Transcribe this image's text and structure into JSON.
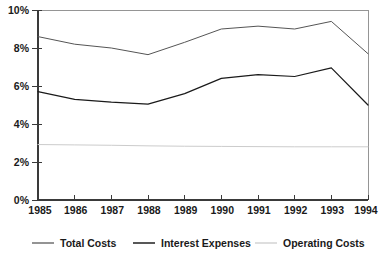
{
  "chart_data": {
    "type": "line",
    "title": "",
    "subtitle": "",
    "xlabel": "",
    "ylabel": "",
    "x": [
      1985,
      1986,
      1987,
      1988,
      1989,
      1990,
      1991,
      1992,
      1993,
      1994
    ],
    "categories": [
      "1985",
      "1986",
      "1987",
      "1988",
      "1989",
      "1990",
      "1991",
      "1992",
      "1993",
      "1994"
    ],
    "xlim": [
      1985,
      1994
    ],
    "ylim": [
      0,
      10
    ],
    "y_ticks": [
      0,
      2,
      4,
      6,
      8,
      10
    ],
    "y_tick_labels": [
      "0%",
      "2%",
      "4%",
      "6%",
      "8%",
      "10%"
    ],
    "x_tick_labels": [
      "1985",
      "1986",
      "1987",
      "1988",
      "1989",
      "1990",
      "1991",
      "1992",
      "1993",
      "1994"
    ],
    "grid": false,
    "legend_position": "bottom",
    "units": "percent",
    "series": [
      {
        "name": "Total Costs",
        "color": "#555555",
        "values": [
          8.6,
          8.2,
          8.0,
          7.65,
          8.3,
          9.0,
          9.15,
          9.0,
          9.4,
          7.7
        ]
      },
      {
        "name": "Interest Expenses",
        "color": "#1a1a1a",
        "values": [
          5.7,
          5.3,
          5.15,
          5.05,
          5.6,
          6.4,
          6.6,
          6.5,
          6.95,
          5.0
        ]
      },
      {
        "name": "Operating Costs",
        "color": "#cccccc",
        "values": [
          2.92,
          2.9,
          2.88,
          2.85,
          2.83,
          2.82,
          2.81,
          2.8,
          2.8,
          2.8
        ]
      }
    ]
  },
  "legend": {
    "items": [
      {
        "label": "Total Costs",
        "color": "#666666"
      },
      {
        "label": "Interest Expenses",
        "color": "#111111"
      },
      {
        "label": "Operating Costs",
        "color": "#d0d0d0"
      }
    ]
  },
  "axes": {
    "y_labels": [
      "10%",
      "8%",
      "6%",
      "4%",
      "2%",
      "0%"
    ],
    "x_labels": [
      "1985",
      "1986",
      "1987",
      "1988",
      "1989",
      "1990",
      "1991",
      "1992",
      "1993",
      "1994"
    ]
  }
}
